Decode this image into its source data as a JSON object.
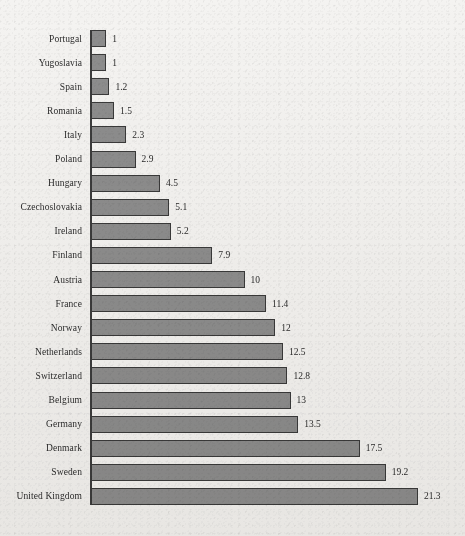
{
  "chart_data": {
    "type": "bar",
    "orientation": "horizontal",
    "title": "",
    "subtitle": "",
    "xlabel": "",
    "ylabel": "",
    "xlim": [
      0,
      21.3
    ],
    "grid": false,
    "legend": null,
    "data_labels": true,
    "categories": [
      "Portugal",
      "Yugoslavia",
      "Spain",
      "Romania",
      "Italy",
      "Poland",
      "Hungary",
      "Czechoslovakia",
      "Ireland",
      "Finland",
      "Austria",
      "France",
      "Norway",
      "Netherlands",
      "Switzerland",
      "Belgium",
      "Germany",
      "Denmark",
      "Sweden",
      "United Kingdom"
    ],
    "values": [
      1,
      1,
      1.2,
      1.5,
      2.3,
      2.9,
      4.5,
      5.1,
      5.2,
      7.9,
      10,
      11.4,
      12,
      12.5,
      12.8,
      13,
      13.5,
      17.5,
      19.2,
      21.3
    ],
    "value_labels": [
      "1",
      "1",
      "1.2",
      "1.5",
      "2.3",
      "2.9",
      "4.5",
      "5.1",
      "5.2",
      "7.9",
      "10",
      "11.4",
      "12",
      "12.5",
      "12.8",
      "13",
      "13.5",
      "17.5",
      "19.2",
      "21.3"
    ],
    "colors": {
      "bar_fill": "#8d8d8d",
      "bar_border": "#3a3a3a",
      "axis": "#3c3c3c",
      "text": "#2b2b2b",
      "background": "#f4f3f1"
    }
  },
  "layout": {
    "plot_left": 91,
    "first_row_top": 30,
    "row_pitch": 24.1,
    "bar_height": 17,
    "px_per_unit": 15.35,
    "value_gap": 6
  }
}
